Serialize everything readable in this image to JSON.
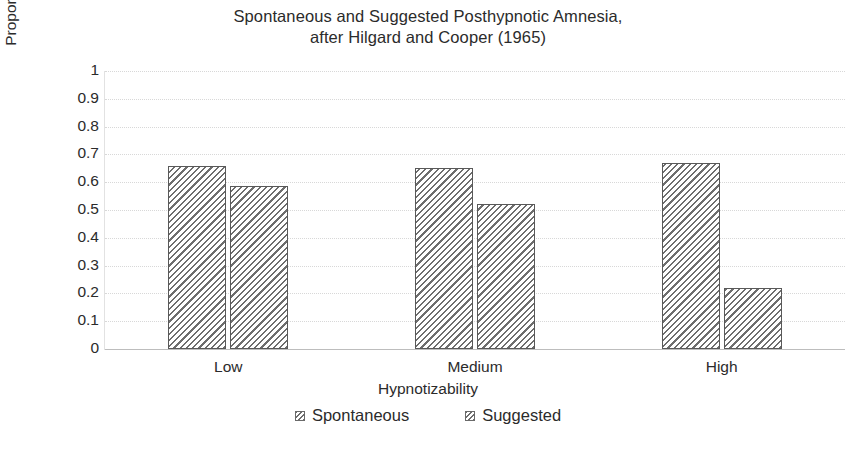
{
  "chart_data": {
    "type": "bar",
    "title": "Spontaneous and Suggested Posthypnotic Amnesia, after Hilgard and Cooper (1965)",
    "title_lines": [
      "Spontaneous and Suggested Posthypnotic Amnesia,",
      "after Hilgard and Cooper (1965)"
    ],
    "categories": [
      "Low",
      "Medium",
      "High"
    ],
    "series": [
      {
        "name": "Spontaneous",
        "values": [
          0.66,
          0.65,
          0.67
        ]
      },
      {
        "name": "Suggested",
        "values": [
          0.585,
          0.52,
          0.22
        ]
      }
    ],
    "xlabel": "Hypnotizability",
    "ylabel": "Proportion of Items Recalled",
    "ylim": [
      0,
      1
    ],
    "ytick_labels": [
      "1",
      "0.9",
      "0.8",
      "0.7",
      "0.6",
      "0.5",
      "0.4",
      "0.3",
      "0.2",
      "0.1",
      "0"
    ],
    "ytick_values": [
      1,
      0.9,
      0.8,
      0.7,
      0.6,
      0.5,
      0.4,
      0.3,
      0.2,
      0.1,
      0
    ],
    "grid": true,
    "grid_axis": "y",
    "legend_position": "bottom",
    "legend_entries": [
      "Spontaneous",
      "Suggested"
    ],
    "colors": {
      "bar_fill": "#ffffff",
      "bar_hatch": "#6e6e6e",
      "bar_edge": "#595959",
      "grid": "#d8d8d8",
      "text": "#2b2b2b",
      "background": "#ffffff"
    }
  }
}
